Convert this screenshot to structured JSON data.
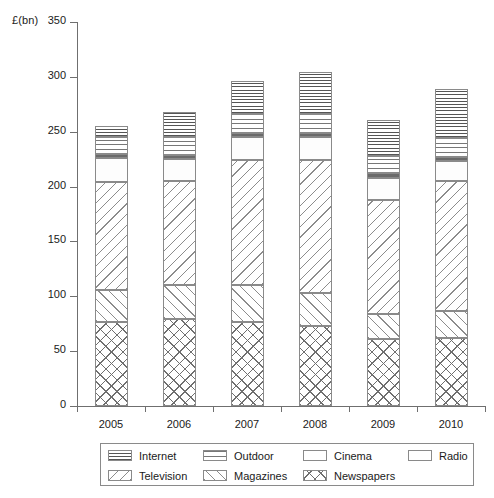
{
  "chart_data": {
    "type": "bar",
    "subtype": "stacked-bar",
    "title": "",
    "xlabel": "",
    "ylabel": "£(bn)",
    "ylim": [
      0,
      350
    ],
    "yticks": [
      0,
      50,
      100,
      150,
      200,
      250,
      300,
      350
    ],
    "grid": false,
    "legend_position": "bottom",
    "categories": [
      "2005",
      "2006",
      "2007",
      "2008",
      "2009",
      "2010"
    ],
    "stack_order_bottom_to_top": [
      "Newspapers",
      "Magazines",
      "Television",
      "Radio",
      "Cinema",
      "Outdoor",
      "Internet"
    ],
    "series": [
      {
        "name": "Newspapers",
        "pattern": "crosshatch",
        "values": [
          77,
          79,
          77,
          73,
          61,
          62
        ]
      },
      {
        "name": "Magazines",
        "pattern": "forward-diagonal",
        "values": [
          29,
          31,
          33,
          30,
          23,
          25
        ]
      },
      {
        "name": "Television",
        "pattern": "backward-diagonal",
        "values": [
          98,
          95,
          114,
          121,
          104,
          118
        ]
      },
      {
        "name": "Radio",
        "pattern": "solid-white",
        "values": [
          22,
          20,
          21,
          21,
          20,
          18
        ]
      },
      {
        "name": "Cinema",
        "pattern": "solid-dark",
        "values": [
          4,
          4,
          4,
          4,
          4,
          4
        ]
      },
      {
        "name": "Outdoor",
        "pattern": "dotted",
        "values": [
          15,
          16,
          17,
          17,
          16,
          17
        ]
      },
      {
        "name": "Internet",
        "pattern": "horizontal-lines",
        "values": [
          10,
          23,
          30,
          38,
          33,
          45
        ]
      }
    ],
    "totals": [
      255,
      268,
      296,
      304,
      261,
      289
    ]
  },
  "axis": {
    "ylabel": "£(bn)",
    "ytick_labels": [
      "350",
      "300",
      "250",
      "200",
      "150",
      "100",
      "50",
      "0"
    ],
    "xtick_labels": [
      "2005",
      "2006",
      "2007",
      "2008",
      "2009",
      "2010"
    ]
  },
  "legend": {
    "rows": [
      [
        {
          "label": "Internet",
          "pattern": "horizontal-lines"
        },
        {
          "label": "Outdoor",
          "pattern": "dotted"
        },
        {
          "label": "Cinema",
          "pattern": "solid-dark"
        },
        {
          "label": "Radio",
          "pattern": "solid-white"
        }
      ],
      [
        {
          "label": "Television",
          "pattern": "backward-diagonal"
        },
        {
          "label": "Magazines",
          "pattern": "forward-diagonal"
        },
        {
          "label": "Newspapers",
          "pattern": "crosshatch"
        }
      ]
    ]
  },
  "colors": {
    "axis": "#6f6f6f",
    "outline": "#8a8a8a",
    "cinema_fill": "#6b6b6b",
    "hatch": "#8c8c8c",
    "background": "#ffffff",
    "text": "#1a1a1a"
  }
}
